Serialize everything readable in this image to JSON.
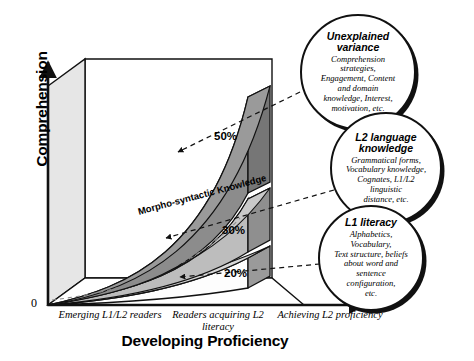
{
  "figure": {
    "axes": {
      "y_title": "Comprehension",
      "x_title": "Developing Proficiency",
      "origin_label": "0",
      "x_ticks": [
        "Emerging L1/L2\nreaders",
        "Readers acquiring\nL2 literacy",
        "Achieving\nL2 proficiency"
      ]
    },
    "bands": [
      {
        "id": "top",
        "percent": "50%",
        "label": "",
        "fill": "#8c8c8c"
      },
      {
        "id": "middle",
        "percent": "30%",
        "label": "Morpho-syntactic Knowledge",
        "fill": "#bdbdbd"
      },
      {
        "id": "bottom",
        "percent": "20%",
        "label": "",
        "fill": "#fdfdfd"
      }
    ],
    "bubbles": [
      {
        "id": "unexplained-variance",
        "title": "Unexplained\nvariance",
        "body": "Comprehension\nstrategies,\nEngagement, Content\nand domain\nknowledge, Interest,\nmotivation, etc."
      },
      {
        "id": "l2-language-knowledge",
        "title": "L2 language\nknowledge",
        "body": "Grammatical forms,\nVocabulary knowledge,\nCognates, L1/L2\nlinguistic\ndistance, etc."
      },
      {
        "id": "l1-literacy",
        "title": "L1 literacy",
        "body": "Alphabetics,\nVocabulary,\nText structure, beliefs\nabout word and\nsentence\nconfiguration,\netc."
      }
    ],
    "colors": {
      "outline": "#111111",
      "wall_left": "#e6e6e6",
      "wall_right_dark": "#8a8a8a",
      "band_top": "#8c8c8c",
      "band_middle": "#bdbdbd",
      "band_bottom": "#fdfdfd",
      "background": "#ffffff"
    }
  }
}
